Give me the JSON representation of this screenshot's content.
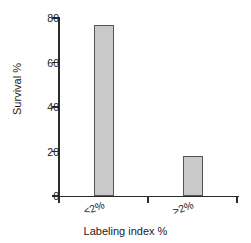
{
  "chart_data": {
    "type": "bar",
    "title": "",
    "categories": [
      "<2%",
      ">2%"
    ],
    "values": [
      77,
      18
    ],
    "xlabel": "Labeling index %",
    "ylabel": "Survival %",
    "ylim": [
      0,
      80
    ],
    "yticks": [
      0,
      20,
      40,
      60,
      80
    ],
    "ytick_labels": [
      "0",
      "20",
      "40",
      "60",
      "80"
    ],
    "grid": false,
    "legend": false,
    "bar_fill_color": "#c9c9c9",
    "bar_edge_color": "#555555",
    "axis_color": "#2b2b2b",
    "background_color": "#ffffff",
    "category_label_rotation_deg": -20
  }
}
